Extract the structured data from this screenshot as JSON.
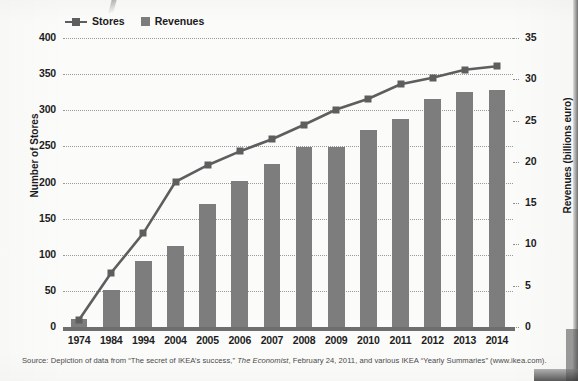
{
  "legend": {
    "items": [
      {
        "label": "Stores",
        "marker": "line-square-marker",
        "color": "#5e5e5e"
      },
      {
        "label": "Revenues",
        "marker": "filled-square",
        "color": "#7d7d7d"
      }
    ]
  },
  "axis": {
    "left_title": "Number of Stores",
    "right_title": "Revenues (billions euro)",
    "left_ticks": [
      "0",
      "50",
      "100",
      "150",
      "200",
      "250",
      "300",
      "350",
      "400"
    ],
    "right_ticks": [
      "0",
      "5",
      "10",
      "15",
      "20",
      "25",
      "30",
      "35"
    ]
  },
  "source": {
    "prefix": "Source: Depiction of data from “The secret of IKEA’s success,” ",
    "italic": "The Economist",
    "suffix": ", February 24, 2011, and various IKEA “Yearly Summaries” (www.ikea.com)."
  },
  "chart_data": {
    "type": "bar",
    "title": "",
    "subtitle": "",
    "xlabel": "",
    "ylabel": "Number of Stores",
    "y2label": "Revenues (billions euro)",
    "categories": [
      "1974",
      "1984",
      "1994",
      "2004",
      "2005",
      "2006",
      "2007",
      "2008",
      "2009",
      "2010",
      "2011",
      "2012",
      "2013",
      "2014"
    ],
    "ylim": [
      0,
      400
    ],
    "y2lim": [
      0,
      35
    ],
    "ytick_step": 50,
    "y2tick_step": 5,
    "grid": true,
    "legend_position": "top-left",
    "series": [
      {
        "name": "Revenues",
        "type": "bar",
        "axis": "right",
        "unit": "billions euro",
        "color": "#7d7d7d",
        "values": [
          1.0,
          4.5,
          8.0,
          9.8,
          14.9,
          17.7,
          19.8,
          21.8,
          21.8,
          23.8,
          25.2,
          27.6,
          28.5,
          28.7
        ]
      },
      {
        "name": "Stores",
        "type": "line",
        "axis": "left",
        "unit": "stores",
        "color": "#5e5e5e",
        "values": [
          10,
          75,
          130,
          201,
          224,
          243,
          260,
          280,
          301,
          316,
          336,
          345,
          356,
          361
        ]
      }
    ]
  }
}
